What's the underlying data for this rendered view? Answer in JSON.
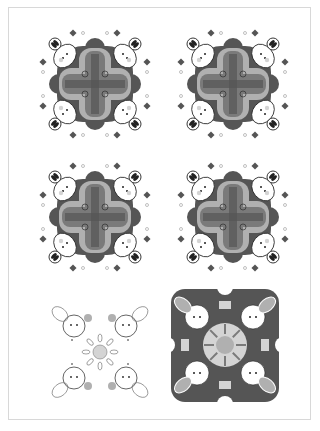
{
  "page": {
    "tiles": [
      {
        "id": "tile-1",
        "style": "mandala-cross",
        "row": 1,
        "col": 1
      },
      {
        "id": "tile-2",
        "style": "mandala-cross",
        "row": 1,
        "col": 2
      },
      {
        "id": "tile-3",
        "style": "mandala-cross",
        "row": 2,
        "col": 1
      },
      {
        "id": "tile-4",
        "style": "mandala-cross",
        "row": 2,
        "col": 2
      },
      {
        "id": "tile-5",
        "style": "line-art-kaleidoscope",
        "row": 3,
        "col": 1
      },
      {
        "id": "tile-6",
        "style": "filled-kaleidoscope",
        "row": 3,
        "col": 2
      }
    ],
    "colors": {
      "dark": "#555555",
      "mid": "#7a7a7a",
      "light": "#b0b0b0",
      "pale": "#d4d4d4",
      "ink": "#222222",
      "paper": "#ffffff",
      "border": "#d8d8d8"
    }
  }
}
